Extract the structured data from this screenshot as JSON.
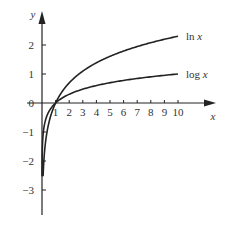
{
  "chart_data": {
    "type": "line",
    "title": "",
    "xlabel": "x",
    "ylabel": "y",
    "x_ticks": [
      "1",
      "2",
      "3",
      "4",
      "5",
      "6",
      "7",
      "8",
      "9",
      "10"
    ],
    "y_ticks": [
      "2",
      "1",
      "0",
      "-1",
      "-2",
      "-3"
    ],
    "xlim": [
      0,
      12.8
    ],
    "ylim": [
      -3.9,
      3.1
    ],
    "grid": false,
    "legend": "inline labels at curve ends",
    "series": [
      {
        "name": "ln x",
        "label_main": "ln",
        "label_var": "x",
        "function": "ln(x)",
        "x_range": [
          0.08,
          10
        ],
        "values_at_ticks": [
          0,
          0.69,
          1.1,
          1.39,
          1.61,
          1.79,
          1.95,
          2.08,
          2.2,
          2.3
        ]
      },
      {
        "name": "log x",
        "label_main": "log",
        "label_var": "x",
        "function": "log10(x)",
        "x_range": [
          0.003,
          10
        ],
        "values_at_ticks": [
          0,
          0.3,
          0.48,
          0.6,
          0.7,
          0.78,
          0.85,
          0.9,
          0.95,
          1.0
        ]
      }
    ],
    "color": "#222222"
  }
}
